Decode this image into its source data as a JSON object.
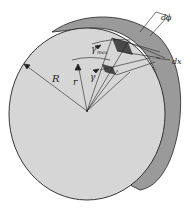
{
  "diagram": {
    "labels": {
      "R": "R",
      "r": "r",
      "gamma": "γ",
      "gamma_max": "γ",
      "gamma_max_sub": "max",
      "dphi": "dϕ",
      "dx": "dx"
    },
    "colors": {
      "face": "#d6d6d6",
      "rim": "#9a9a9a",
      "element_dark": "#4a4a4a",
      "line": "#222222"
    }
  }
}
